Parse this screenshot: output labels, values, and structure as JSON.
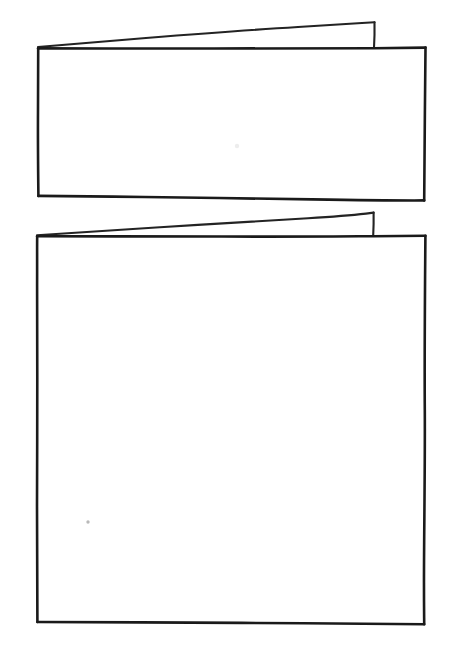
{
  "canvas": {
    "width": 455,
    "height": 668,
    "background_color": "#ffffff",
    "ink_color": "#1a1a1a",
    "medium": "pen-on-paper sketch",
    "title": "Two hand-drawn rectangles each with a thin wedge flap along the top edge"
  },
  "shapes": [
    {
      "id": "shape-1",
      "name": "upper-card",
      "description": "Hand-drawn rectangle with a narrow triangular wedge flap rising above its top edge",
      "body": {
        "name": "upper-card-body",
        "top_left": [
          38,
          48
        ],
        "top_right": [
          425,
          48
        ],
        "bottom_right": [
          424,
          200
        ],
        "bottom_left": [
          38,
          196
        ],
        "width": 387,
        "height": 152
      },
      "flap": {
        "name": "upper-card-flap",
        "apex": [
          38,
          47
        ],
        "peak": [
          374,
          22
        ],
        "drop_foot": [
          374,
          48
        ],
        "max_thickness": 26
      }
    },
    {
      "id": "shape-2",
      "name": "lower-card",
      "description": "Hand-drawn rectangle with a narrow triangular wedge flap rising above its top edge",
      "body": {
        "name": "lower-card-body",
        "top_left": [
          37,
          236
        ],
        "top_right": [
          425,
          236
        ],
        "bottom_right": [
          424,
          624
        ],
        "bottom_left": [
          37,
          622
        ],
        "width": 388,
        "height": 388
      },
      "flap": {
        "name": "lower-card-flap",
        "apex": [
          37,
          235
        ],
        "peak": [
          373,
          212
        ],
        "drop_foot": [
          373,
          236
        ],
        "max_thickness": 24
      }
    }
  ],
  "marks": [
    {
      "name": "paper-speck-upper",
      "x": 237,
      "y": 146,
      "radius": 2.2,
      "tone": "very-faint"
    },
    {
      "name": "paper-speck-lower",
      "x": 88,
      "y": 522,
      "radius": 1.7,
      "tone": "faint"
    }
  ],
  "labels": {
    "alt_text": "Sketch of two blank rectangular cards, each drawn freehand with a thin tapering flap along the top edge."
  }
}
